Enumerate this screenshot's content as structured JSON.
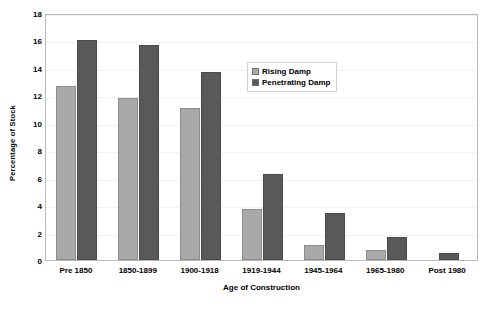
{
  "chart_data": {
    "type": "bar",
    "title": "",
    "xlabel": "Age of Construction",
    "ylabel": "Percentage of Stock",
    "categories": [
      "Pre 1850",
      "1850-1899",
      "1900-1918",
      "1919-1944",
      "1945-1964",
      "1965-1980",
      "Post 1980"
    ],
    "series": [
      {
        "name": "Rising Damp",
        "color": "#a9a9a9",
        "values": [
          12.7,
          11.8,
          11.1,
          3.7,
          1.1,
          0.7,
          0
        ]
      },
      {
        "name": "Penetrating Damp",
        "color": "#595959",
        "values": [
          16.0,
          15.7,
          13.7,
          6.3,
          3.4,
          1.7,
          0.5
        ]
      }
    ],
    "ylim": [
      0,
      18
    ],
    "yticks": [
      0,
      2,
      4,
      6,
      8,
      10,
      12,
      14,
      16,
      18
    ],
    "ytick_labels": [
      "0",
      "2",
      "4",
      "6",
      "8",
      "10",
      "12",
      "14",
      "16",
      "18"
    ],
    "grid": true,
    "grid_axis": "y",
    "legend_position": "upper center",
    "plot_border_color": "#b9b9b9",
    "gridline_color": "#f2f2f2",
    "background_color": "#ffffff"
  }
}
